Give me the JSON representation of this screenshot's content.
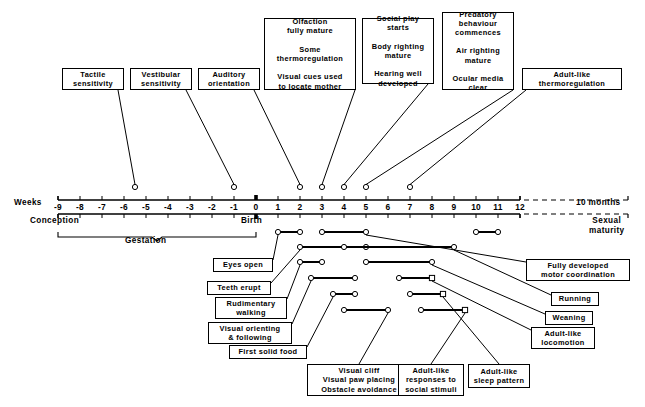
{
  "figure": {
    "type": "timeline-diagram",
    "title": "",
    "axis": {
      "label": "Weeks",
      "unit_left": "Weeks",
      "tick_labels": [
        "-9",
        "-8",
        "-7",
        "-6",
        "-5",
        "-4",
        "-3",
        "-2",
        "-1",
        "0",
        "1",
        "2",
        "3",
        "4",
        "5",
        "6",
        "7",
        "8",
        "9",
        "10",
        "11",
        "12"
      ],
      "tick_values": [
        -9,
        -8,
        -7,
        -6,
        -5,
        -4,
        -3,
        -2,
        -1,
        0,
        1,
        2,
        3,
        4,
        5,
        6,
        7,
        8,
        9,
        10,
        11,
        12
      ],
      "break_label": "10 months",
      "origin_label": "Birth",
      "start_label": "Conception",
      "span_label": "Gestation",
      "end_label": "Sexual\nmaturity"
    },
    "above_events": [
      {
        "name": "tactile-sensitivity",
        "label": "Tactile\nsensitivity",
        "week": -5.5
      },
      {
        "name": "vestibular-sensitivity",
        "label": "Vestibular\nsensitivity",
        "week": -1.0
      },
      {
        "name": "auditory-orientation",
        "label": "Auditory\norientation",
        "week": 2.0
      },
      {
        "name": "olfaction-thermoregulation-visual-cues",
        "label": "Olfaction\nfully mature\n\nSome\nthermoregulation\n\nVisual cues used\nto locate mother",
        "week": 3.0
      },
      {
        "name": "social-play-body-righting-hearing",
        "label": "Social play\nstarts\n\nBody righting\nmature\n\nHearing well\ndeveloped",
        "week": 4.0
      },
      {
        "name": "predatory-air-righting-ocular",
        "label": "Predatory\nbehaviour\ncommences\n\nAir righting\nmature\n\nOcular media\nclear",
        "week": 5.0
      },
      {
        "name": "adult-like-thermoregulation",
        "label": "Adult-like\nthermoregulation",
        "week": 7.0
      }
    ],
    "below_events": [
      {
        "name": "eyes-open",
        "label": "Eyes open",
        "start": 1.0,
        "end": 2.0
      },
      {
        "name": "teeth-erupt",
        "label": "Teeth erupt",
        "start": 2.0,
        "end": 5.0
      },
      {
        "name": "rudimentary-walking",
        "label": "Rudimentary\nwalking",
        "start": 2.0,
        "end": 3.0
      },
      {
        "name": "visual-orienting-following",
        "label": "Visual orienting\n& following",
        "start": 2.5,
        "end": 4.5
      },
      {
        "name": "first-solid-food",
        "label": "First solid food",
        "start": 3.5,
        "end": 4.5
      },
      {
        "name": "visual-cliff-paw-placing-obstacle",
        "label": "Visual cliff\nVisual paw placing\nObstacle avoidance",
        "start": 4.0,
        "end": 6.0
      },
      {
        "name": "fully-developed-motor-coordination",
        "label": "Fully developed\nmotor coordination",
        "start": 3.0,
        "end": 5.0
      },
      {
        "name": "running",
        "label": "Running",
        "start": 4.0,
        "end": 9.0
      },
      {
        "name": "weaning",
        "label": "Weaning",
        "start": 5.0,
        "end": 8.0
      },
      {
        "name": "adult-like-locomotion",
        "label": "Adult-like\nlocomotion",
        "start": 6.5,
        "end": 8.0
      },
      {
        "name": "adult-like-responses-social",
        "label": "Adult-like\nresponses to\nsocial stimuli",
        "start": 7.5,
        "end": 9.5
      },
      {
        "name": "adult-like-sleep-pattern",
        "label": "Adult-like\nsleep pattern",
        "start": 7.0,
        "end": 8.5
      },
      {
        "name": "late-bar-10-11",
        "label": "",
        "start": 10.0,
        "end": 11.0
      }
    ],
    "colors": {
      "line": "#000000",
      "background": "#ffffff",
      "marker_fill": "#ffffff"
    }
  }
}
